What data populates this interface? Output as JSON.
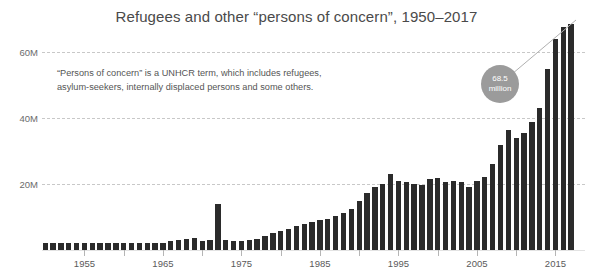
{
  "chart_data": {
    "type": "bar",
    "title": "Refugees and other “persons of concern”, 1950–2017",
    "xlabel": "",
    "ylabel": "",
    "ylim": [
      0,
      72
    ],
    "yunit": "M",
    "ytick_labels": [
      "20M",
      "40M",
      "60M"
    ],
    "ytick_values": [
      20,
      40,
      60
    ],
    "xtick_labels": [
      "1955",
      "1965",
      "1975",
      "1985",
      "1995",
      "2005",
      "2015"
    ],
    "xtick_values": [
      1955,
      1965,
      1975,
      1985,
      1995,
      2005,
      2015
    ],
    "minor_xtick_values": [
      1960,
      1970,
      1980,
      1990,
      2000,
      2010
    ],
    "grid": true,
    "legend": "none",
    "bar_color": "#2b2b2b",
    "gridline_color": "#c8c8c8",
    "categories": [
      1950,
      1951,
      1952,
      1953,
      1954,
      1955,
      1956,
      1957,
      1958,
      1959,
      1960,
      1961,
      1962,
      1963,
      1964,
      1965,
      1966,
      1967,
      1968,
      1969,
      1970,
      1971,
      1972,
      1973,
      1974,
      1975,
      1976,
      1977,
      1978,
      1979,
      1980,
      1981,
      1982,
      1983,
      1984,
      1985,
      1986,
      1987,
      1988,
      1989,
      1990,
      1991,
      1992,
      1993,
      1994,
      1995,
      1996,
      1997,
      1998,
      1999,
      2000,
      2001,
      2002,
      2003,
      2004,
      2005,
      2006,
      2007,
      2008,
      2009,
      2010,
      2011,
      2012,
      2013,
      2014,
      2015,
      2016,
      2017
    ],
    "values": [
      2.1,
      2.2,
      2.2,
      2.1,
      2.1,
      2.1,
      2.0,
      2.1,
      2.1,
      2.2,
      2.1,
      2.1,
      2.1,
      2.1,
      2.2,
      2.2,
      2.6,
      3.0,
      3.3,
      3.6,
      2.6,
      2.9,
      14.0,
      3.0,
      2.7,
      2.7,
      3.0,
      3.3,
      4.2,
      5.1,
      5.8,
      6.5,
      7.3,
      8.0,
      8.5,
      9.1,
      9.5,
      10.3,
      11.3,
      12.5,
      14.8,
      17.2,
      19.0,
      20.0,
      23.0,
      20.8,
      20.5,
      20.0,
      19.8,
      21.5,
      21.9,
      20.7,
      20.8,
      20.6,
      19.2,
      21.0,
      22.2,
      26.0,
      31.7,
      36.5,
      33.9,
      35.4,
      38.7,
      42.9,
      54.9,
      63.9,
      67.7,
      68.5
    ],
    "annotations": [
      {
        "name": "definition-note",
        "text": "“Persons of concern” is a UNHCR term, which includes refugees, asylum-seekers, internally displaced persons and some others.",
        "line1": "“Persons of concern” is a UNHCR term, which includes refugees,",
        "line2": "asylum-seekers, internally displaced persons and some others."
      },
      {
        "name": "final-value-callout",
        "value": "68.5",
        "unit": "million",
        "target_year": 2017,
        "target_value": 68.5,
        "color": "#9b9b9b"
      }
    ]
  }
}
